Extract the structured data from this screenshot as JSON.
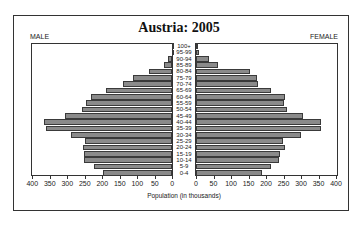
{
  "chart_data": {
    "type": "bar",
    "subtype": "population-pyramid",
    "title": "Austria: 2005",
    "left_label": "MALE",
    "right_label": "FEMALE",
    "xlabel": "Population (in thousands)",
    "ylabel": "",
    "xlim": [
      0,
      400
    ],
    "left_ticks": [
      "400",
      "350",
      "300",
      "250",
      "200",
      "150",
      "100",
      "50",
      "0"
    ],
    "right_ticks": [
      "0",
      "50",
      "100",
      "150",
      "200",
      "250",
      "300",
      "350",
      "400"
    ],
    "categories": [
      "0-4",
      "5-9",
      "10-14",
      "15-19",
      "20-24",
      "25-29",
      "30-34",
      "35-39",
      "40-44",
      "45-49",
      "50-54",
      "55-59",
      "60-64",
      "65-69",
      "70-74",
      "75-79",
      "80-84",
      "85-89",
      "90-94",
      "95-99",
      "100+"
    ],
    "series": [
      {
        "name": "MALE",
        "values": [
          197,
          223,
          251,
          252,
          256,
          249,
          290,
          361,
          367,
          307,
          259,
          246,
          233,
          190,
          140,
          111,
          67,
          24,
          11,
          1,
          0
        ]
      },
      {
        "name": "FEMALE",
        "values": [
          188,
          213,
          238,
          240,
          254,
          248,
          299,
          356,
          356,
          305,
          259,
          250,
          254,
          214,
          178,
          173,
          154,
          64,
          37,
          9,
          1
        ]
      }
    ],
    "bar_color": "#8a8a8a",
    "grid": false,
    "legend": "none"
  }
}
